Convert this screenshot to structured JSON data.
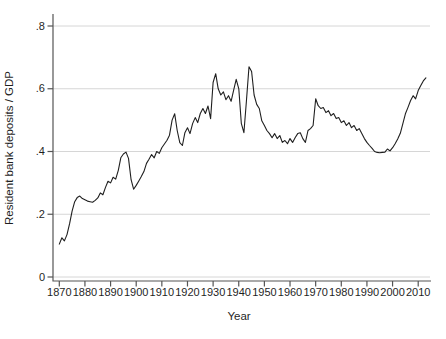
{
  "chart_data": {
    "type": "line",
    "title": "",
    "xlabel": "Year",
    "ylabel": "Resident bank deposits / GDP",
    "ylim": [
      0,
      0.8
    ],
    "xlim": [
      1870,
      2013
    ],
    "grid": "horizontal",
    "legend": "none",
    "x_ticks": [
      1870,
      1880,
      1890,
      1900,
      1910,
      1920,
      1930,
      1940,
      1950,
      1960,
      1970,
      1980,
      1990,
      2000,
      2010
    ],
    "y_ticks": [
      {
        "value": 0,
        "label": "0"
      },
      {
        "value": 0.2,
        "label": ".2"
      },
      {
        "value": 0.4,
        "label": ".4"
      },
      {
        "value": 0.6,
        "label": ".6"
      },
      {
        "value": 0.8,
        "label": ".8"
      }
    ],
    "series": [
      {
        "name": "Resident bank deposits / GDP",
        "color": "#1f1f1f",
        "x": [
          1870,
          1871,
          1872,
          1873,
          1874,
          1875,
          1876,
          1877,
          1878,
          1879,
          1880,
          1881,
          1882,
          1883,
          1884,
          1885,
          1886,
          1887,
          1888,
          1889,
          1890,
          1891,
          1892,
          1893,
          1894,
          1895,
          1896,
          1897,
          1898,
          1899,
          1900,
          1901,
          1902,
          1903,
          1904,
          1905,
          1906,
          1907,
          1908,
          1909,
          1910,
          1911,
          1912,
          1913,
          1914,
          1915,
          1916,
          1917,
          1918,
          1919,
          1920,
          1921,
          1922,
          1923,
          1924,
          1925,
          1926,
          1927,
          1928,
          1929,
          1930,
          1931,
          1932,
          1933,
          1934,
          1935,
          1936,
          1937,
          1938,
          1939,
          1940,
          1941,
          1942,
          1943,
          1944,
          1945,
          1946,
          1947,
          1948,
          1949,
          1950,
          1951,
          1952,
          1953,
          1954,
          1955,
          1956,
          1957,
          1958,
          1959,
          1960,
          1961,
          1962,
          1963,
          1964,
          1965,
          1966,
          1967,
          1968,
          1969,
          1970,
          1971,
          1972,
          1973,
          1974,
          1975,
          1976,
          1977,
          1978,
          1979,
          1980,
          1981,
          1982,
          1983,
          1984,
          1985,
          1986,
          1987,
          1988,
          1989,
          1990,
          1991,
          1992,
          1993,
          1994,
          1995,
          1996,
          1997,
          1998,
          1999,
          2000,
          2001,
          2002,
          2003,
          2004,
          2005,
          2006,
          2007,
          2008,
          2009,
          2010,
          2011,
          2012,
          2013
        ],
        "values": [
          0.105,
          0.125,
          0.115,
          0.135,
          0.17,
          0.21,
          0.24,
          0.253,
          0.258,
          0.25,
          0.246,
          0.242,
          0.24,
          0.238,
          0.244,
          0.252,
          0.268,
          0.262,
          0.285,
          0.305,
          0.3,
          0.318,
          0.312,
          0.34,
          0.38,
          0.392,
          0.398,
          0.378,
          0.31,
          0.28,
          0.292,
          0.306,
          0.32,
          0.336,
          0.362,
          0.375,
          0.39,
          0.38,
          0.4,
          0.394,
          0.412,
          0.424,
          0.436,
          0.452,
          0.5,
          0.52,
          0.467,
          0.428,
          0.419,
          0.46,
          0.476,
          0.457,
          0.489,
          0.508,
          0.492,
          0.521,
          0.537,
          0.521,
          0.545,
          0.505,
          0.62,
          0.648,
          0.6,
          0.58,
          0.59,
          0.565,
          0.578,
          0.56,
          0.595,
          0.63,
          0.6,
          0.49,
          0.46,
          0.56,
          0.67,
          0.655,
          0.58,
          0.55,
          0.537,
          0.498,
          0.483,
          0.467,
          0.457,
          0.444,
          0.457,
          0.441,
          0.451,
          0.429,
          0.435,
          0.425,
          0.441,
          0.429,
          0.444,
          0.457,
          0.46,
          0.441,
          0.429,
          0.467,
          0.473,
          0.483,
          0.568,
          0.546,
          0.537,
          0.54,
          0.524,
          0.53,
          0.514,
          0.521,
          0.505,
          0.508,
          0.492,
          0.498,
          0.483,
          0.492,
          0.476,
          0.483,
          0.467,
          0.473,
          0.457,
          0.441,
          0.429,
          0.419,
          0.41,
          0.4,
          0.397,
          0.396,
          0.397,
          0.398,
          0.408,
          0.402,
          0.412,
          0.425,
          0.44,
          0.458,
          0.488,
          0.52,
          0.54,
          0.562,
          0.578,
          0.568,
          0.594,
          0.61,
          0.625,
          0.635
        ]
      }
    ]
  },
  "colors": {
    "background": "#ffffff",
    "gridline": "#d6d6d6",
    "axis": "#555555",
    "text": "#1f1f1f",
    "line": "#1f1f1f"
  }
}
